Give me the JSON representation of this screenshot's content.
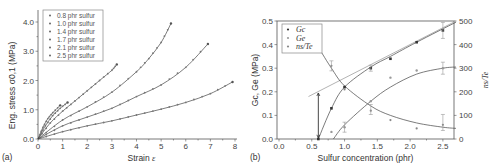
{
  "chart_data": [
    {
      "type": "line",
      "panel_label": "(a)",
      "title": "",
      "xlabel": "Strain ε",
      "ylabel": "Eng. stress σ0,1 (MPa)",
      "xlim": [
        0,
        8
      ],
      "ylim": [
        0,
        4.5
      ],
      "xticks": [
        "0",
        "1",
        "2",
        "3",
        "4",
        "5",
        "6",
        "7",
        "8"
      ],
      "yticks": [
        "0.0",
        "1.0",
        "2.0",
        "3.0",
        "4.0"
      ],
      "grid": false,
      "legend_position": "upper left",
      "series": [
        {
          "name": "0.8 phr sulfur",
          "x": [
            0,
            1,
            2,
            3,
            4,
            5,
            6,
            7,
            7.9
          ],
          "y": [
            0,
            0.25,
            0.45,
            0.62,
            0.82,
            1.02,
            1.25,
            1.55,
            1.95
          ]
        },
        {
          "name": "1.0 phr sulfur",
          "x": [
            0,
            1,
            2,
            3,
            4,
            5,
            6,
            6.9
          ],
          "y": [
            0,
            0.45,
            0.75,
            1.05,
            1.45,
            1.85,
            2.45,
            3.25
          ]
        },
        {
          "name": "1.4 phr sulfur",
          "x": [
            0,
            1,
            2,
            3,
            4,
            4.5,
            5,
            5.4
          ],
          "y": [
            0,
            0.65,
            1.1,
            1.6,
            2.3,
            2.75,
            3.3,
            3.95
          ]
        },
        {
          "name": "1.7 phr sulfur",
          "x": [
            0,
            0.5,
            1,
            1.5,
            2,
            2.5,
            3,
            3.2
          ],
          "y": [
            0,
            0.55,
            0.95,
            1.3,
            1.65,
            2.0,
            2.35,
            2.55
          ]
        },
        {
          "name": "2.1 phr sulfur",
          "x": [
            0,
            0.3,
            0.6,
            0.9,
            1.2
          ],
          "y": [
            0,
            0.45,
            0.8,
            1.05,
            1.25
          ]
        },
        {
          "name": "2.5 phr sulfur",
          "x": [
            0,
            0.2,
            0.4,
            0.6,
            0.9
          ],
          "y": [
            0,
            0.4,
            0.7,
            0.9,
            1.15
          ]
        }
      ]
    },
    {
      "type": "scatter",
      "panel_label": "(b)",
      "title": "",
      "xlabel": "Sulfur concentration (phr)",
      "ylabel": "Gc, Ge (MPa)",
      "y2label": "ns/Te",
      "xlim": [
        0,
        2.7
      ],
      "ylim": [
        0,
        0.5
      ],
      "y2lim": [
        0,
        500
      ],
      "xticks": [
        "0.0",
        "0.5",
        "1.0",
        "1.5",
        "2.0",
        "2.5"
      ],
      "yticks": [
        "0.0",
        "0.1",
        "0.2",
        "0.3",
        "0.4",
        "0.5"
      ],
      "y2ticks": [
        "0",
        "100",
        "200",
        "300",
        "400",
        "500"
      ],
      "grid": false,
      "legend_position": "upper left",
      "series": [
        {
          "name": "Gc",
          "axis": "left",
          "x": [
            0.6,
            0.8,
            1.0,
            1.4,
            1.7,
            2.1,
            2.5
          ],
          "y": [
            0.0,
            0.13,
            0.22,
            0.3,
            0.34,
            0.41,
            0.46
          ]
        },
        {
          "name": "Ge",
          "axis": "left",
          "x": [
            0.8,
            1.0,
            1.4,
            1.7,
            2.1,
            2.5
          ],
          "y": [
            0.03,
            0.05,
            0.16,
            0.26,
            0.29,
            0.3
          ]
        },
        {
          "name": "ns/Te",
          "axis": "right",
          "x": [
            0.8,
            1.0,
            1.4,
            1.7,
            2.1,
            2.5
          ],
          "y": [
            310,
            210,
            120,
            80,
            45,
            60
          ]
        }
      ],
      "annotations": [
        "vertical double arrow at x=0.6 from 0.0 to 0.2"
      ]
    }
  ],
  "panels": {
    "a": {
      "label": "(a)",
      "xlabel": "Strain ",
      "xlabel_sym": "ε",
      "ylabel": "Eng. stress σ0,1 (MPa)"
    },
    "b": {
      "label": "(b)",
      "xlabel": "Sulfur concentration (phr)",
      "ylabel": "Gc, Ge (MPa)",
      "y2label": "ns/Te",
      "legend": [
        "Gc",
        "Ge",
        "ns/Te"
      ]
    }
  }
}
